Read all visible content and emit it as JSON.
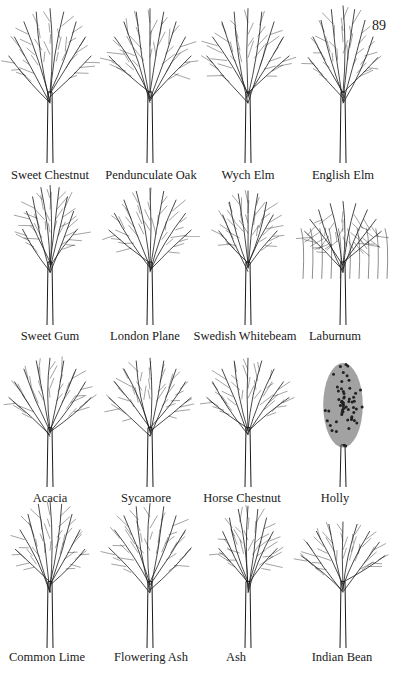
{
  "page": {
    "number": "89"
  },
  "rows": [
    {
      "trees": [
        {
          "name": "Sweet Chestnut",
          "shape": "broad",
          "label_x": 50,
          "label_y": 168
        },
        {
          "name": "Pendunculate Oak",
          "shape": "oak",
          "label_x": 151,
          "label_y": 168
        },
        {
          "name": "Wych Elm",
          "shape": "round",
          "label_x": 248,
          "label_y": 168
        },
        {
          "name": "English Elm",
          "shape": "tall",
          "label_x": 343,
          "label_y": 168
        }
      ]
    },
    {
      "trees": [
        {
          "name": "Sweet Gum",
          "shape": "cone",
          "label_x": 50,
          "label_y": 329
        },
        {
          "name": "London Plane",
          "shape": "broad",
          "label_x": 145,
          "label_y": 329
        },
        {
          "name": "Swedish Whitebeam",
          "shape": "oval",
          "label_x": 245,
          "label_y": 329
        },
        {
          "name": "Laburnum",
          "shape": "weeping",
          "label_x": 335,
          "label_y": 329
        }
      ]
    },
    {
      "trees": [
        {
          "name": "Acacia",
          "shape": "broad",
          "label_x": 50,
          "label_y": 491
        },
        {
          "name": "Sycamore",
          "shape": "round",
          "label_x": 146,
          "label_y": 491
        },
        {
          "name": "Horse Chestnut",
          "shape": "round",
          "label_x": 242,
          "label_y": 491
        },
        {
          "name": "Holly",
          "shape": "dense",
          "label_x": 335,
          "label_y": 491
        }
      ]
    },
    {
      "trees": [
        {
          "name": "Common Lime",
          "shape": "tall",
          "label_x": 47,
          "label_y": 650
        },
        {
          "name": "Flowering Ash",
          "shape": "round",
          "label_x": 151,
          "label_y": 650
        },
        {
          "name": "Ash",
          "shape": "oval",
          "label_x": 236,
          "label_y": 650
        },
        {
          "name": "Indian Bean",
          "shape": "spread",
          "label_x": 342,
          "label_y": 650
        }
      ]
    }
  ],
  "colors": {
    "ink": "#1a1a1a",
    "paper": "#ffffff"
  }
}
